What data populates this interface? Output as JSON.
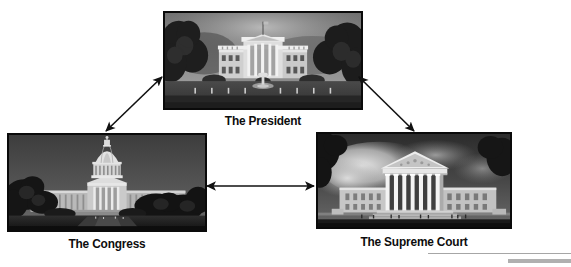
{
  "diagram": {
    "nodes": [
      {
        "id": "president",
        "label": "The President",
        "icon": "white-house-photo",
        "branch": "executive",
        "position": "top-center"
      },
      {
        "id": "congress",
        "label": "The Congress",
        "icon": "us-capitol-photo",
        "branch": "legislative",
        "position": "bottom-left"
      },
      {
        "id": "supreme-court",
        "label": "The Supreme Court",
        "icon": "supreme-court-photo",
        "branch": "judicial",
        "position": "bottom-right"
      }
    ],
    "connections": [
      {
        "id": "congress-president",
        "from": "congress",
        "to": "president",
        "style": "double-headed-arrow"
      },
      {
        "id": "president-supreme",
        "from": "president",
        "to": "supreme-court",
        "style": "double-headed-arrow"
      },
      {
        "id": "congress-supreme",
        "from": "congress",
        "to": "supreme-court",
        "style": "double-headed-arrow"
      }
    ],
    "decorations": [
      {
        "id": "rule-thin",
        "type": "horizontal-line",
        "color": "#a6a6a6"
      },
      {
        "id": "rule-thick",
        "type": "horizontal-bar",
        "color": "#b0b0b0"
      }
    ],
    "colors": {
      "background": "#ffffff",
      "arrow": "#111111",
      "caption": "#0d0d0d",
      "photo_border": "#0a0a0a"
    }
  }
}
